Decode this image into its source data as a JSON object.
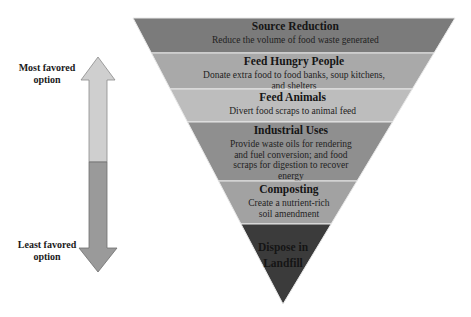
{
  "diagram": {
    "type": "inverted-pyramid-hierarchy",
    "arrow": {
      "top_label": [
        "Most favored",
        "option"
      ],
      "bottom_label": [
        "Least favored",
        "option"
      ],
      "top_color": "#cfcfcf",
      "bottom_color": "#9a9a9a"
    },
    "levels": [
      {
        "title": "Source Reduction",
        "description": [
          "Reduce the volume of food waste generated"
        ],
        "color": "#7b7b7b"
      },
      {
        "title": "Feed Hungry People",
        "description": [
          "Donate extra food to food banks, soup kitchens,",
          "and shelters"
        ],
        "color": "#a9a9a9"
      },
      {
        "title": "Feed Animals",
        "description": [
          "Divert food scraps to animal feed"
        ],
        "color": "#bdbdbd"
      },
      {
        "title": "Industrial Uses",
        "description": [
          "Provide waste oils for rendering",
          "and fuel conversion; and food",
          "scraps for digestion to recover",
          "energy"
        ],
        "color": "#8f8f8f"
      },
      {
        "title": "Composting",
        "description": [
          "Create a nutrient-rich",
          "soil amendment"
        ],
        "color": "#a2a2a2"
      },
      {
        "title": "Dispose in Landfill",
        "title_lines": [
          "Dispose in",
          "Landfill"
        ],
        "description": [],
        "color": "#3b3b3b"
      }
    ]
  }
}
